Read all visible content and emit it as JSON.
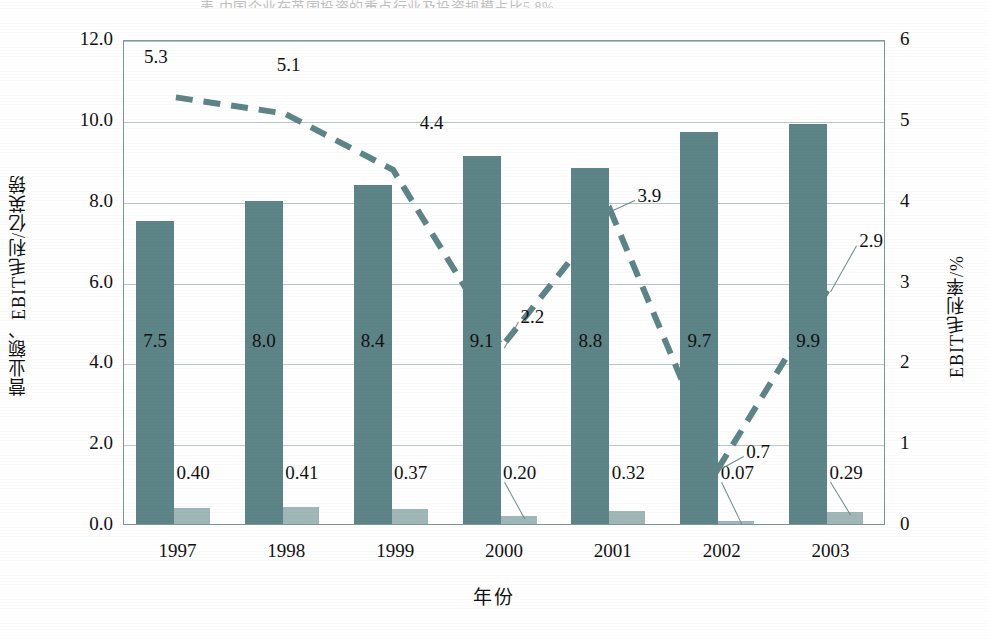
{
  "page": {
    "partial_header_text": "表 中国企业在英国投资的重点行业及投资规模占比5.8%。"
  },
  "chart_data": {
    "type": "bar",
    "title": "",
    "categories": [
      "1997",
      "1998",
      "1999",
      "2000",
      "2001",
      "2002",
      "2003"
    ],
    "xlabel": "年份",
    "ylabel": "营业额、EBIT毛利/亿英镑",
    "ylabel_right": "EBIT毛利率/%",
    "ylim": [
      0,
      12
    ],
    "ylim_right": [
      0,
      6
    ],
    "yticks": [
      "0.0",
      "2.0",
      "4.0",
      "6.0",
      "8.0",
      "10.0",
      "12.0"
    ],
    "yticks_right": [
      "0",
      "1",
      "2",
      "3",
      "4",
      "5",
      "6"
    ],
    "grid": true,
    "legend": "none",
    "series": [
      {
        "name": "营业额/亿英镑",
        "kind": "bar",
        "axis": "left",
        "color": "#5d8486",
        "values": [
          7.5,
          8.0,
          8.4,
          9.1,
          8.8,
          9.7,
          9.9
        ],
        "labels": [
          "7.5",
          "8.0",
          "8.4",
          "9.1",
          "8.8",
          "9.7",
          "9.9"
        ]
      },
      {
        "name": "EBIT毛利/亿英镑",
        "kind": "bar",
        "axis": "left",
        "color": "#9fb7b6",
        "values": [
          0.4,
          0.41,
          0.37,
          0.2,
          0.32,
          0.07,
          0.29
        ],
        "labels": [
          "0.40",
          "0.41",
          "0.37",
          "0.20",
          "0.32",
          "0.07",
          "0.29"
        ]
      },
      {
        "name": "EBIT毛利率/%",
        "kind": "line",
        "axis": "right",
        "style": "dashed",
        "color": "#5d8486",
        "values": [
          5.3,
          5.1,
          4.4,
          2.2,
          3.9,
          0.7,
          2.9
        ],
        "labels": [
          "5.3",
          "5.1",
          "4.4",
          "2.2",
          "3.9",
          "0.7",
          "2.9"
        ]
      }
    ]
  },
  "axis_colors": {
    "frame": "#7d9a99",
    "grid": "#b6c9c7",
    "text": "#111111"
  }
}
